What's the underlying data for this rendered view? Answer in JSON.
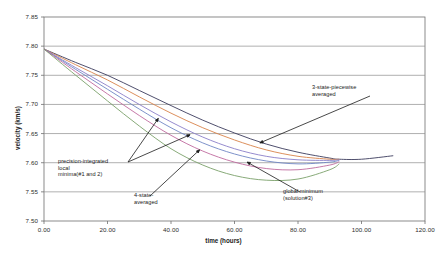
{
  "chart_data": {
    "type": "line",
    "title": "",
    "xlabel": "time (hours)",
    "ylabel": "velocity (km/s)",
    "xlim": [
      0.0,
      120.0
    ],
    "ylim": [
      7.5,
      7.85
    ],
    "xticks": [
      "0.00",
      "20.00",
      "40.00",
      "60.00",
      "80.00",
      "100.00",
      "120.00"
    ],
    "yticks": [
      "7.50",
      "7.55",
      "7.60",
      "7.65",
      "7.70",
      "7.75",
      "7.80",
      "7.85"
    ],
    "grid": "horizontal",
    "legend": "none",
    "x": [
      0,
      10,
      20,
      30,
      40,
      50,
      60,
      70,
      80,
      90,
      93,
      100,
      110
    ],
    "series": [
      {
        "name": "3-state-piecewise averaged",
        "color": "#3b3b5c",
        "values": [
          7.795,
          7.772,
          7.75,
          7.724,
          7.698,
          7.673,
          7.651,
          7.632,
          7.618,
          7.608,
          7.606,
          7.606,
          7.612
        ]
      },
      {
        "name": "curve-orange",
        "color": "#d8824a",
        "values": [
          7.795,
          7.768,
          7.742,
          7.713,
          7.685,
          7.66,
          7.639,
          7.622,
          7.611,
          7.606,
          7.606,
          null,
          null
        ]
      },
      {
        "name": "curve-purple",
        "color": "#8a7ec8",
        "values": [
          7.795,
          7.763,
          7.732,
          7.7,
          7.67,
          7.644,
          7.624,
          7.611,
          7.605,
          7.604,
          7.605,
          null,
          null
        ]
      },
      {
        "name": "curve-blue",
        "color": "#6f86c4",
        "values": [
          7.795,
          7.76,
          7.726,
          7.692,
          7.66,
          7.634,
          7.615,
          7.603,
          7.598,
          7.601,
          7.604,
          null,
          null
        ]
      },
      {
        "name": "curve-magenta",
        "color": "#c06a9e",
        "values": [
          7.795,
          7.756,
          7.718,
          7.681,
          7.647,
          7.62,
          7.601,
          7.59,
          7.588,
          7.596,
          7.602,
          null,
          null
        ]
      },
      {
        "name": "4-state-averaged",
        "color": "#7aa06a",
        "values": [
          7.795,
          7.75,
          7.706,
          7.663,
          7.624,
          7.596,
          7.578,
          7.57,
          7.572,
          7.588,
          7.598,
          null,
          null
        ]
      }
    ],
    "annotations": [
      {
        "id": "3state",
        "text": "3-state-piecewise\naveraged",
        "target_x": 68.0,
        "target_y": 7.634
      },
      {
        "id": "precision",
        "text": "precision-integrated\nlocal\nminima(#1 and 2)",
        "target_x": 36.0,
        "target_y": 7.676
      },
      {
        "id": "4state",
        "text": "4-state-\naveraged",
        "target_x": 49.0,
        "target_y": 7.622
      },
      {
        "id": "global",
        "text": "global minimum\n(solution#3)",
        "target_x": 64.0,
        "target_y": 7.601
      }
    ]
  }
}
